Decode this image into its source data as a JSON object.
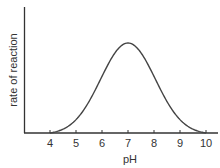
{
  "chart_data": {
    "type": "line",
    "title": "",
    "xlabel": "pH",
    "ylabel": "rate of reaction",
    "x_ticks": [
      "4",
      "5",
      "6",
      "7",
      "8",
      "9",
      "10"
    ],
    "x": [
      4,
      4.5,
      5,
      5.5,
      6,
      6.5,
      7,
      7.5,
      8,
      8.5,
      9,
      9.5,
      10
    ],
    "values": [
      0,
      0.08,
      0.2,
      0.4,
      0.66,
      0.9,
      1.0,
      0.9,
      0.66,
      0.4,
      0.2,
      0.08,
      0
    ],
    "xlim": [
      3,
      10.5
    ],
    "ylim": [
      0,
      1.1
    ],
    "grid": false,
    "legend": "none",
    "y_ticks": [],
    "annotations": [
      "Bell-shaped curve with optimum rate at pH 7"
    ],
    "line_color": "#444444"
  }
}
